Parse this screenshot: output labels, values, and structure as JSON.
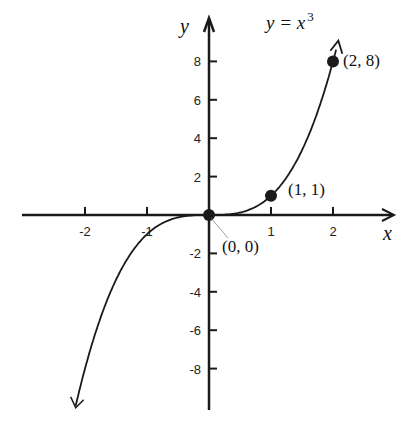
{
  "chart_data": {
    "type": "line",
    "equation_label": {
      "lhs": "y = x",
      "exponent": "3"
    },
    "xlabel": "x",
    "ylabel": "y",
    "xlim": [
      -2.2,
      2.2
    ],
    "ylim": [
      -10,
      10
    ],
    "x_ticks": [
      "-2",
      "-1",
      "1",
      "2"
    ],
    "y_ticks": [
      "8",
      "6",
      "4",
      "2",
      "-2",
      "-4",
      "-6",
      "-8"
    ],
    "grid": false,
    "series": [
      {
        "name": "y = x^3",
        "x": [
          -2.0,
          -1.5,
          -1.0,
          -0.5,
          0,
          0.5,
          1.0,
          1.5,
          2.0
        ],
        "y": [
          -8,
          -3.375,
          -1,
          -0.125,
          0,
          0.125,
          1,
          3.375,
          8
        ]
      }
    ],
    "points": [
      {
        "label": "(0, 0)",
        "x": 0,
        "y": 0
      },
      {
        "label": "(1, 1)",
        "x": 1,
        "y": 1
      },
      {
        "label": "(2, 8)",
        "x": 2,
        "y": 8
      }
    ]
  }
}
